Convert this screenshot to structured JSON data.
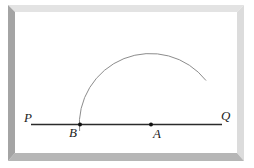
{
  "diagram": {
    "line": {
      "from_label": "P",
      "to_label": "Q"
    },
    "points": [
      {
        "label": "B",
        "x": 80,
        "y": 124
      },
      {
        "label": "A",
        "x": 151,
        "y": 124
      }
    ],
    "arc": {
      "center": "A",
      "through": "B",
      "radius": 71
    },
    "colors": {
      "line": "#2a2a2a",
      "arc": "#8a8a8a",
      "frame_dark": "#9a9a9a",
      "frame_mid": "#c4c4c4",
      "frame_light": "#e2e2e2"
    }
  },
  "labels": {
    "P": "P",
    "Q": "Q",
    "A": "A",
    "B": "B"
  }
}
